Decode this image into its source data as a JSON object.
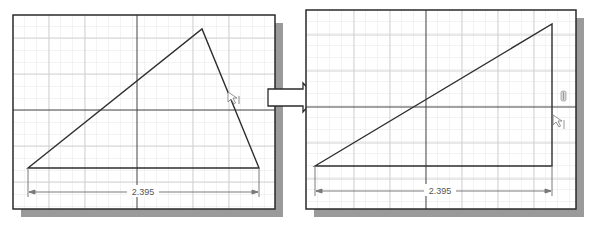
{
  "figure": {
    "colors": {
      "background": "#ffffff",
      "panel_border": "#2a2a2a",
      "shadow": "#9a9a9a",
      "grid_minor": "#e4e4e4",
      "grid_major": "#cfcfcf",
      "axis": "#333333",
      "geometry": "#2e2e2e",
      "dimension": "#7a7a7a",
      "arrow_fill": "#ffffff",
      "arrow_stroke": "#2a2a2a"
    }
  },
  "panels": [
    {
      "id": "before",
      "dimension_label": "2.395",
      "cursor_icon": "constraint-cursor-icon"
    },
    {
      "id": "after",
      "dimension_label": "2.395",
      "cursor_icon": "constraint-cursor-icon",
      "constraint_glyph": "vertical-constraint-icon"
    }
  ],
  "transition_arrow": {
    "direction": "right"
  }
}
